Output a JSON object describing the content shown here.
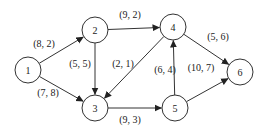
{
  "nodes": [
    {
      "id": "1",
      "label": "1",
      "x": 28,
      "y": 70
    },
    {
      "id": "2",
      "label": "2",
      "x": 95,
      "y": 30
    },
    {
      "id": "3",
      "label": "3",
      "x": 95,
      "y": 108
    },
    {
      "id": "4",
      "label": "4",
      "x": 173,
      "y": 27
    },
    {
      "id": "5",
      "label": "5",
      "x": 175,
      "y": 108
    },
    {
      "id": "6",
      "label": "6",
      "x": 240,
      "y": 72
    }
  ],
  "edges": [
    {
      "from": "1",
      "to": "2",
      "label": "(8, 2)",
      "lx": 44,
      "ly": 47
    },
    {
      "from": "1",
      "to": "3",
      "label": "(7, 8)",
      "lx": 48,
      "ly": 96
    },
    {
      "from": "2",
      "to": "4",
      "label": "(9, 2)",
      "lx": 130,
      "ly": 18
    },
    {
      "from": "2",
      "to": "3",
      "label": "(5, 5)",
      "lx": 80,
      "ly": 67
    },
    {
      "from": "4",
      "to": "3",
      "label": "(2, 1)",
      "lx": 123,
      "ly": 67
    },
    {
      "from": "3",
      "to": "5",
      "label": "(9, 3)",
      "lx": 130,
      "ly": 123
    },
    {
      "from": "5",
      "to": "4",
      "label": "(6, 4)",
      "lx": 165,
      "ly": 73
    },
    {
      "from": "5",
      "to": "6",
      "label": "(10, 7)",
      "lx": 201,
      "ly": 71
    },
    {
      "from": "4",
      "to": "6",
      "label": "(5, 6)",
      "lx": 218,
      "ly": 40
    }
  ],
  "style": {
    "stroke": "#333333",
    "radius": 13
  }
}
